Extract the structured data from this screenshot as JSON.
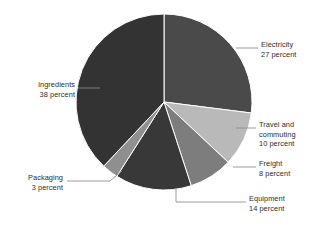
{
  "chart_data": {
    "type": "pie",
    "title": "",
    "subtitle": "",
    "xlabel": "",
    "ylabel": "",
    "unit": "percent",
    "legend_position": "callout-labels",
    "grid": false,
    "start_angle_deg": 0,
    "direction": "clockwise",
    "categories": [
      "Electricity",
      "Travel and commuting",
      "Freight",
      "Equipment",
      "Packaging",
      "Ingredients"
    ],
    "values": [
      27,
      10,
      8,
      14,
      3,
      38
    ],
    "colors": [
      "#4a4a4a",
      "#b9b9b9",
      "#7d7d7d",
      "#383838",
      "#8f8f8f",
      "#333333"
    ],
    "slices": [
      {
        "name": "Electricity",
        "value": 27,
        "value_text": "27 percent",
        "label_line1": "Electricity",
        "label_line2": "27 percent",
        "color": "#4a4a4a"
      },
      {
        "name": "Travel and commuting",
        "value": 10,
        "value_text": "10 percent",
        "label_line1": "Travel and",
        "label_line2": "commuting",
        "label_line3": "10 percent",
        "color": "#b9b9b9"
      },
      {
        "name": "Freight",
        "value": 8,
        "value_text": "8 percent",
        "label_line1": "Freight",
        "label_line2": "8 percent",
        "color": "#7d7d7d"
      },
      {
        "name": "Equipment",
        "value": 14,
        "value_text": "14 percent",
        "label_line1": "Equipment",
        "label_line2": "14 percent",
        "color": "#383838"
      },
      {
        "name": "Packaging",
        "value": 3,
        "value_text": "3 percent",
        "label_line1": "Packaging",
        "label_line2": "3 percent",
        "color": "#8f8f8f"
      },
      {
        "name": "Ingredients",
        "value": 38,
        "value_text": "38 percent",
        "label_line1": "Ingredients",
        "label_line2": "38 percent",
        "color": "#333333"
      }
    ]
  },
  "style": {
    "background": "#ffffff",
    "text_color": "#2c2c2c",
    "leader_line_color": "#8d8d8d",
    "slice_separator_color": "#ffffff"
  }
}
